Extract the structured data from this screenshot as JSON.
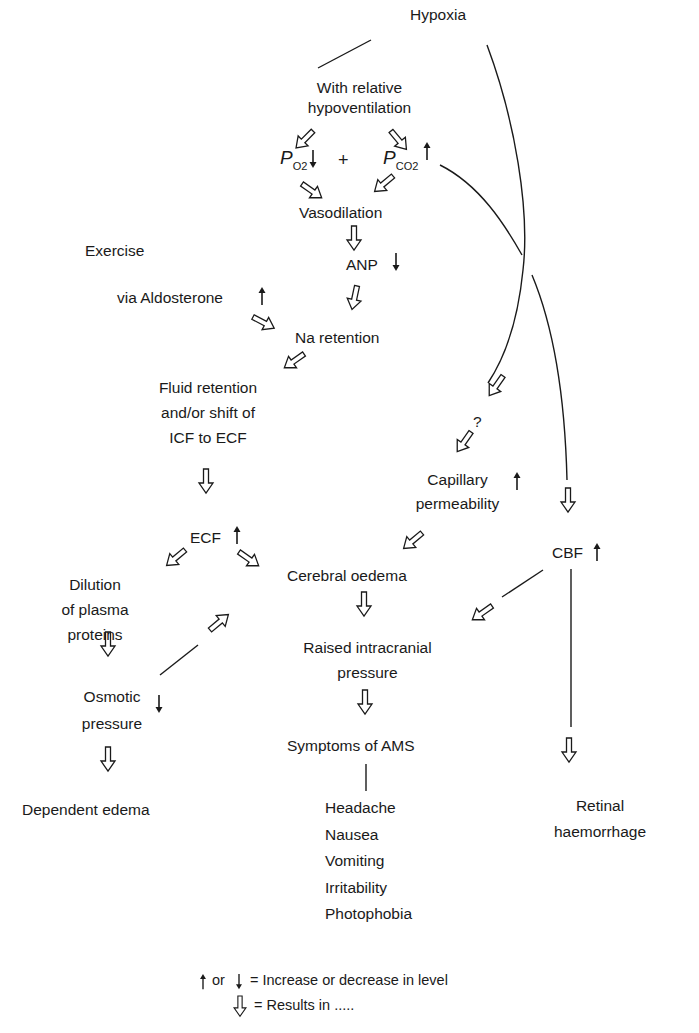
{
  "diagram": {
    "nodes": {
      "hypoxia": "Hypoxia",
      "relative_hypo_1": "With relative",
      "relative_hypo_2": "hypoventilation",
      "po2_p": "P",
      "po2_sub": "O2",
      "plus": "+",
      "pco2_p": "P",
      "pco2_sub": "CO2",
      "vasodilation": "Vasodilation",
      "anp": "ANP",
      "exercise": "Exercise",
      "aldosterone": "via Aldosterone",
      "na_retention": "Na retention",
      "fluid_1": "Fluid retention",
      "fluid_2": "and/or shift of",
      "fluid_3": "ICF to ECF",
      "question": "?",
      "capillary_1": "Capillary",
      "capillary_2": "permeability",
      "ecf": "ECF",
      "cbf": "CBF",
      "dilution_1": "Dilution",
      "dilution_2": "of plasma",
      "dilution_3": "proteins",
      "cerebral_oedema": "Cerebral oedema",
      "raised_icp_1": "Raised intracranial",
      "raised_icp_2": "pressure",
      "osmotic_1": "Osmotic",
      "osmotic_2": "pressure",
      "symptoms": "Symptoms of AMS",
      "dependent_edema": "Dependent edema",
      "retinal_1": "Retinal",
      "retinal_2": "haemorrhage"
    },
    "symptom_list": [
      "Headache",
      "Nausea",
      "Vomiting",
      "Irritability",
      "Photophobia"
    ],
    "level_indicators": {
      "po2": "down",
      "pco2": "up",
      "anp": "down",
      "aldosterone": "up",
      "capillary_permeability": "up",
      "ecf": "up",
      "cbf": "up",
      "osmotic_pressure": "down"
    },
    "legend": {
      "or_text": "or",
      "increase_decrease": "= Increase or decrease in level",
      "results_in": "= Results in ....."
    },
    "colors": {
      "ink": "#1a1a1a",
      "background": "#ffffff"
    }
  }
}
